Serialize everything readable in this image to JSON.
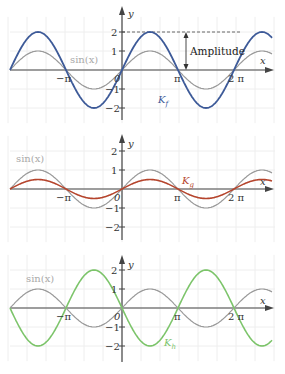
{
  "chart_data": [
    {
      "type": "line",
      "title": "",
      "xlabel": "x",
      "ylabel": "y",
      "x_ticks": [
        "-π",
        "0",
        "π",
        "2π"
      ],
      "y_ticks": [
        "-2",
        "-1",
        "1",
        "2"
      ],
      "xlim": [
        -6.2832,
        8.4
      ],
      "ylim": [
        -2.5,
        2.5
      ],
      "grid": true,
      "series": [
        {
          "name": "sin(x)",
          "expr": "sin(x)",
          "amplitude": 1,
          "color": "#9a9a9a"
        },
        {
          "name": "K_f",
          "expr": "2·sin(x)",
          "amplitude": 2,
          "color": "#3d5a98"
        }
      ],
      "annotations": [
        {
          "text": "Amplitude",
          "from_y": 0,
          "to_y": 2,
          "x": "≈1.15π"
        }
      ]
    },
    {
      "type": "line",
      "title": "",
      "xlabel": "x",
      "ylabel": "y",
      "x_ticks": [
        "-π",
        "0",
        "π",
        "2π"
      ],
      "y_ticks": [
        "-2",
        "-1",
        "1",
        "2"
      ],
      "xlim": [
        -6.2832,
        8.4
      ],
      "ylim": [
        -2.5,
        2.5
      ],
      "grid": true,
      "series": [
        {
          "name": "sin(x)",
          "expr": "sin(x)",
          "amplitude": 1,
          "color": "#9a9a9a"
        },
        {
          "name": "K_g",
          "expr": "0.5·sin(x)",
          "amplitude": 0.5,
          "color": "#b5442c"
        }
      ]
    },
    {
      "type": "line",
      "title": "",
      "xlabel": "x",
      "ylabel": "y",
      "x_ticks": [
        "-π",
        "0",
        "π",
        "2π"
      ],
      "y_ticks": [
        "-2",
        "-1",
        "1",
        "2"
      ],
      "xlim": [
        -6.2832,
        8.4
      ],
      "ylim": [
        -2.5,
        2.5
      ],
      "grid": true,
      "series": [
        {
          "name": "sin(x)",
          "expr": "sin(x)",
          "amplitude": 1,
          "color": "#9a9a9a"
        },
        {
          "name": "K_h",
          "expr": "-2·sin(x)",
          "amplitude": -2,
          "color": "#7cc46a"
        }
      ]
    }
  ],
  "labels": {
    "x_axis": "x",
    "y_axis": "y",
    "origin": "0",
    "neg_pi": "−π",
    "pi": "π",
    "two_pi": "2 π",
    "y2": "2",
    "y1": "1",
    "ym1": "−1",
    "ym2": "−2",
    "sin": "sin(x)",
    "amplitude": "Amplitude",
    "kf_main": "K",
    "kf_sub": "f",
    "kg_main": "K",
    "kg_sub": "g",
    "kh_main": "K",
    "kh_sub": "h"
  },
  "colors": {
    "sin": "#9a9a9a",
    "kf": "#3d5a98",
    "kg": "#b5442c",
    "kh": "#7cc46a",
    "axis": "#444444",
    "grid": "#eeeeee"
  }
}
